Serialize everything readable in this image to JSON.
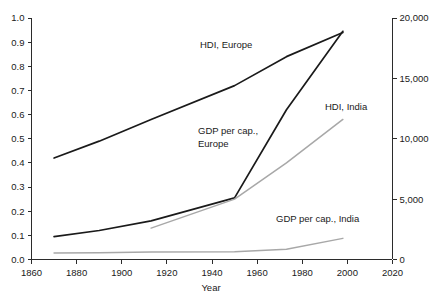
{
  "chart_data": {
    "type": "line",
    "title": "",
    "xlabel": "Year",
    "ylabel": "",
    "xlim": [
      1860,
      2020
    ],
    "grid": false,
    "legend_position": "inline-annotations",
    "x_ticks": [
      "1860",
      "1880",
      "1900",
      "1920",
      "1940",
      "1960",
      "1980",
      "2000",
      "2020"
    ],
    "x_tick_values": [
      1860,
      1880,
      1900,
      1920,
      1940,
      1960,
      1980,
      2000,
      2020
    ],
    "left_axis": {
      "label": "",
      "ylim": [
        0.0,
        1.0
      ],
      "ticks": [
        "0.0",
        "0.1",
        "0.2",
        "0.3",
        "0.4",
        "0.5",
        "0.6",
        "0.7",
        "0.8",
        "0.9",
        "1.0"
      ],
      "tick_values": [
        0.0,
        0.1,
        0.2,
        0.3,
        0.4,
        0.5,
        0.6,
        0.7,
        0.8,
        0.9,
        1.0
      ],
      "note": "Human Development Index scale"
    },
    "right_axis": {
      "label": "",
      "ylim": [
        0,
        20000
      ],
      "ticks": [
        "0",
        "5,000",
        "10,000",
        "15,000",
        "20,000"
      ],
      "tick_values": [
        0,
        5000,
        10000,
        15000,
        20000
      ],
      "note": "GDP per capita scale"
    },
    "series": [
      {
        "name": "HDI, Europe",
        "axis": "left",
        "color": "#1a1a1a",
        "width": 1.7,
        "label_x": 200,
        "label_y": 48,
        "x": [
          1870,
          1890,
          1913,
          1950,
          1973,
          1998
        ],
        "values": [
          0.42,
          0.49,
          0.58,
          0.72,
          0.84,
          0.94
        ]
      },
      {
        "name": "GDP per cap., Europe",
        "axis": "right",
        "color": "#1a1a1a",
        "width": 1.7,
        "label_x": 198,
        "label_y": 134,
        "label_line2": "Europe",
        "x": [
          1870,
          1890,
          1913,
          1950,
          1973,
          1998
        ],
        "values": [
          1900,
          2400,
          3200,
          5100,
          12400,
          18900
        ]
      },
      {
        "name": "HDI, India",
        "axis": "left",
        "color": "#a8a8a8",
        "width": 1.5,
        "label_x": 325,
        "label_y": 110,
        "x": [
          1913,
          1950,
          1973,
          1998
        ],
        "values": [
          0.13,
          0.25,
          0.4,
          0.58
        ]
      },
      {
        "name": "GDP per cap., India",
        "axis": "right",
        "color": "#a8a8a8",
        "width": 1.5,
        "label_x": 276,
        "label_y": 222,
        "x": [
          1870,
          1890,
          1913,
          1950,
          1973,
          1998
        ],
        "values": [
          530,
          560,
          620,
          640,
          850,
          1750
        ]
      }
    ]
  }
}
